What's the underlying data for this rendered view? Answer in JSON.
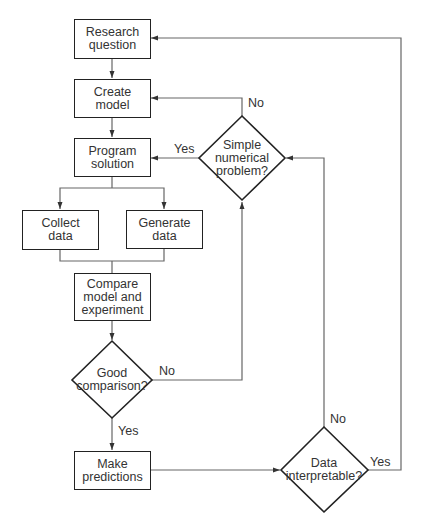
{
  "nodes": {
    "research_question": {
      "label": "Research\nquestion"
    },
    "create_model": {
      "label": "Create\nmodel"
    },
    "program_solution": {
      "label": "Program\nsolution"
    },
    "collect_data": {
      "label": "Collect\ndata"
    },
    "generate_data": {
      "label": "Generate\ndata"
    },
    "compare": {
      "label": "Compare\nmodel and\nexperiment"
    },
    "good_comparison": {
      "label": "Good\ncomparison?"
    },
    "make_predictions": {
      "label": "Make\npredictions"
    },
    "simple_numerical": {
      "label": "Simple\nnumerical\nproblem?"
    },
    "data_interpretable": {
      "label": "Data\ninterpretable?"
    }
  },
  "edge_labels": {
    "simple_no": "No",
    "simple_yes": "Yes",
    "good_no": "No",
    "good_yes": "Yes",
    "data_no": "No",
    "data_yes": "Yes"
  },
  "colors": {
    "line": "#555555",
    "border": "#222222",
    "text": "#333333"
  }
}
